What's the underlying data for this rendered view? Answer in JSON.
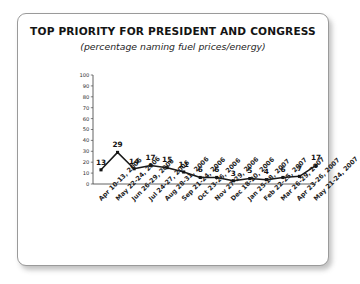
{
  "chart_data": {
    "type": "line",
    "title": "TOP PRIORITY FOR PRESIDENT AND CONGRESS",
    "subtitle": "(percentage naming fuel prices/energy)",
    "xlabel": "",
    "ylabel": "",
    "ylim": [
      0,
      100
    ],
    "yticks": [
      100,
      90,
      80,
      70,
      60,
      50,
      40,
      30,
      20,
      10,
      0
    ],
    "grid": false,
    "legend": "none",
    "marker": "square",
    "line_color": "#1a1a1a",
    "categories": [
      "Apr 10-13, 2006",
      "May 22-24, 2006",
      "Jun 26-29, 2006",
      "Jul 24-27, 2006",
      "Aug 28-31, 2006",
      "Sep 21-24, 2006",
      "Oct 23-26, 2006",
      "Nov 27-29, 2006",
      "Dec 18-20, 2006",
      "Jan 25-28, 2007",
      "Feb 22-25, 2007",
      "Mar 26-29, 2007",
      "Apr 23-26, 2007",
      "May 21-24, 2007"
    ],
    "values": [
      13,
      29,
      14,
      17,
      15,
      11,
      6,
      6,
      3,
      5,
      4,
      6,
      7,
      17
    ],
    "point_labels": [
      "13",
      "29",
      "14",
      "17",
      "15",
      "11",
      "6",
      "6",
      "3",
      "5",
      "4",
      "6",
      "7",
      "17"
    ]
  }
}
